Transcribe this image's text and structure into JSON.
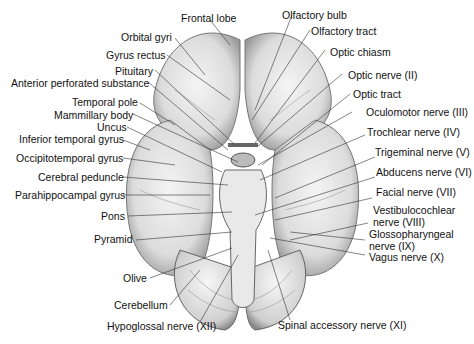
{
  "figure": {
    "labels_left": [
      {
        "id": "frontal-lobe",
        "text": "Frontal lobe"
      },
      {
        "id": "orbital-gyri",
        "text": "Orbital gyri"
      },
      {
        "id": "gyrus-rectus",
        "text": "Gyrus rectus"
      },
      {
        "id": "pituitary",
        "text": "Pituitary"
      },
      {
        "id": "anterior-perforated-substance",
        "text": "Anterior perforated substance"
      },
      {
        "id": "temporal-pole",
        "text": "Temporal pole"
      },
      {
        "id": "mammillary-body",
        "text": "Mammillary body"
      },
      {
        "id": "uncus",
        "text": "Uncus"
      },
      {
        "id": "inferior-temporal-gyrus",
        "text": "Inferior temporal gyrus"
      },
      {
        "id": "occipitotemporal-gyrus",
        "text": "Occipitotemporal gyrus"
      },
      {
        "id": "cerebral-peduncle",
        "text": "Cerebral peduncle"
      },
      {
        "id": "parahippocampal-gyrus",
        "text": "Parahippocampal gyrus"
      },
      {
        "id": "pons",
        "text": "Pons"
      },
      {
        "id": "pyramid",
        "text": "Pyramid"
      },
      {
        "id": "olive",
        "text": "Olive"
      },
      {
        "id": "cerebellum",
        "text": "Cerebellum"
      },
      {
        "id": "hypoglossal-nerve",
        "text": "Hypoglossal nerve (XII)"
      }
    ],
    "labels_right": [
      {
        "id": "olfactory-bulb",
        "text": "Olfactory bulb"
      },
      {
        "id": "olfactory-tract",
        "text": "Olfactory tract"
      },
      {
        "id": "optic-chiasm",
        "text": "Optic chiasm"
      },
      {
        "id": "optic-nerve",
        "text": "Optic nerve (II)"
      },
      {
        "id": "optic-tract",
        "text": "Optic tract"
      },
      {
        "id": "oculomotor-nerve",
        "text": "Oculomotor nerve (III)"
      },
      {
        "id": "trochlear-nerve",
        "text": "Trochlear nerve (IV)"
      },
      {
        "id": "trigeminal-nerve",
        "text": "Trigeminal nerve (V)"
      },
      {
        "id": "abducens-nerve",
        "text": "Abducens nerve (VI)"
      },
      {
        "id": "facial-nerve",
        "text": "Facial nerve (VII)"
      },
      {
        "id": "vestibulocochlear-nerve-1",
        "text": "Vestibulocochlear"
      },
      {
        "id": "vestibulocochlear-nerve-2",
        "text": "nerve (VIII)"
      },
      {
        "id": "glossopharyngeal-nerve-1",
        "text": "Glossopharyngeal"
      },
      {
        "id": "glossopharyngeal-nerve-2",
        "text": "nerve (IX)"
      },
      {
        "id": "vagus-nerve",
        "text": "Vagus nerve (X)"
      },
      {
        "id": "spinal-accessory-nerve",
        "text": "Spinal accessory nerve (XI)"
      }
    ]
  }
}
